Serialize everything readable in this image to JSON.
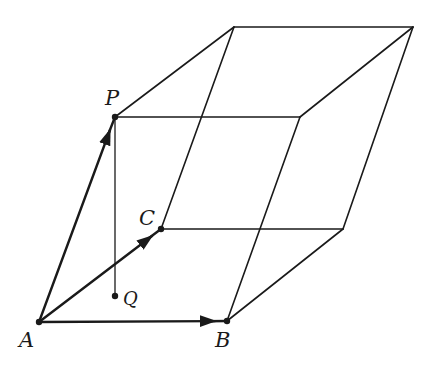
{
  "diagram": {
    "type": "parallelepiped",
    "colors": {
      "stroke": "#1a1a1a",
      "background": "#ffffff"
    },
    "points": {
      "A": {
        "label": "A",
        "x": 39,
        "y": 322
      },
      "B": {
        "label": "B",
        "x": 227,
        "y": 321
      },
      "C": {
        "label": "C",
        "x": 161,
        "y": 229
      },
      "P": {
        "label": "P",
        "x": 115,
        "y": 117
      },
      "Q": {
        "label": "Q",
        "x": 115,
        "y": 296
      }
    },
    "vectors": [
      "AB",
      "AC",
      "AP"
    ],
    "segments": [
      "PQ"
    ]
  }
}
